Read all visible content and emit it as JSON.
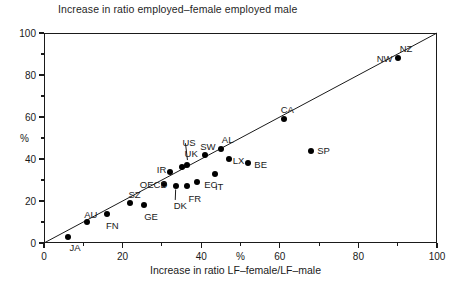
{
  "chart_data": {
    "type": "scatter",
    "title": "Increase in ratio employed–female employed male",
    "xlabel": "Increase in ratio LF–female/LF–male",
    "ylabel": "%",
    "x_unit_label": "%",
    "x_unit_label_value": 50,
    "xlim": [
      0,
      100
    ],
    "ylim": [
      0,
      100
    ],
    "xticks": [
      0,
      20,
      40,
      60,
      80,
      100
    ],
    "xticklabels": [
      "0",
      "20",
      "40",
      "60",
      "80",
      "100"
    ],
    "xminorticks": [
      10,
      30,
      50,
      70,
      90
    ],
    "yticks": [
      0,
      20,
      40,
      60,
      80,
      100
    ],
    "yticklabels": [
      "0",
      "20",
      "40",
      "60",
      "80",
      "100"
    ],
    "yminorticks": [
      10,
      30,
      50,
      70,
      90
    ],
    "grid": false,
    "legend": null,
    "reference_line": {
      "name": "identity-line",
      "from": [
        0,
        0
      ],
      "to": [
        100,
        100
      ],
      "style": "solid"
    },
    "points": [
      {
        "label": "JA",
        "x": 6,
        "y": 3,
        "label_dx": 2,
        "label_dy": 11
      },
      {
        "label": "AU",
        "x": 11,
        "y": 10,
        "label_dx": -3,
        "label_dy": -7
      },
      {
        "label": "FN",
        "x": 16,
        "y": 14,
        "label_dx": -1,
        "label_dy": 12
      },
      {
        "label": "SZ",
        "x": 22,
        "y": 19,
        "label_dx": -2,
        "label_dy": -8
      },
      {
        "label": "GE",
        "x": 25.5,
        "y": 18,
        "label_dx": 0,
        "label_dy": 12
      },
      {
        "label": "OECD",
        "x": 30.5,
        "y": 28,
        "label_dx": -24,
        "label_dy": 1
      },
      {
        "label": "IR",
        "x": 32,
        "y": 34,
        "label_dx": -13,
        "label_dy": -2
      },
      {
        "label": "DK",
        "x": 33.5,
        "y": 27,
        "label_dx": -2,
        "label_dy": 20
      },
      {
        "label": "UK",
        "x": 35,
        "y": 36,
        "label_dx": 3,
        "label_dy": -13
      },
      {
        "label": "US",
        "x": 36.5,
        "y": 37,
        "label_dx": -5,
        "label_dy": -22
      },
      {
        "label": "FR",
        "x": 36.5,
        "y": 27,
        "label_dx": 1,
        "label_dy": 13
      },
      {
        "label": "EC",
        "x": 39,
        "y": 29,
        "label_dx": 7,
        "label_dy": 3
      },
      {
        "label": "SW",
        "x": 41,
        "y": 42,
        "label_dx": -5,
        "label_dy": -8
      },
      {
        "label": "IT",
        "x": 43.5,
        "y": 33,
        "label_dx": 0,
        "label_dy": 13
      },
      {
        "label": "AL",
        "x": 45,
        "y": 45,
        "label_dx": 1,
        "label_dy": -9
      },
      {
        "label": "LX",
        "x": 47,
        "y": 40,
        "label_dx": 4,
        "label_dy": 2
      },
      {
        "label": "BE",
        "x": 52,
        "y": 38,
        "label_dx": 6,
        "label_dy": 2
      },
      {
        "label": "CA",
        "x": 61,
        "y": 59,
        "label_dx": -3,
        "label_dy": -9
      },
      {
        "label": "SP",
        "x": 68,
        "y": 44,
        "label_dx": 6,
        "label_dy": 0
      },
      {
        "label": "NZ",
        "x": 90,
        "y": 88,
        "label_dx": 2,
        "label_dy": -9
      },
      {
        "label": "NW",
        "x": 90,
        "y": 88,
        "label_dx": -21,
        "label_dy": 1
      }
    ],
    "leader_lines": [
      {
        "name": "us-leader",
        "from_x": 36.0,
        "from_y": 47.5,
        "to_x": 36.5,
        "to_y": 39.5
      },
      {
        "name": "dk-leader",
        "from_x": 33.4,
        "from_y": 20.5,
        "to_x": 33.5,
        "to_y": 25.5
      }
    ],
    "colors": {
      "marker": "#000000",
      "axis": "#1a1a1a",
      "text": "#1a1a1a",
      "background": "#ffffff"
    }
  }
}
